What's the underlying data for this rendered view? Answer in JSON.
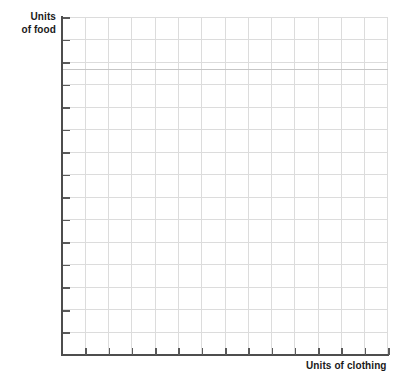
{
  "figure": {
    "type": "blank-grid-worksheet",
    "background_color": "#ffffff",
    "grid_color": "#dcdcdc",
    "axis_color": "#4d4d4d",
    "label_color": "#1a1a1a"
  },
  "y_axis": {
    "label_line1": "Units",
    "label_line2": "of food",
    "label_full": "Units of food",
    "tick_count": 15,
    "tick_labels": []
  },
  "x_axis": {
    "label": "Units of clothing",
    "tick_count": 14,
    "tick_labels": []
  },
  "chart_data": {
    "type": "line",
    "title": "",
    "subtitle": "",
    "xlabel": "Units of clothing",
    "ylabel": "Units of food",
    "series": [],
    "categories": [],
    "x": [],
    "values": [],
    "xlim": [
      0,
      14
    ],
    "ylim": [
      0,
      15
    ],
    "grid": true,
    "grid_columns": 14,
    "grid_rows": 15,
    "legend": false,
    "legend_position": "none",
    "annotations": [],
    "note": "Empty graph paper: axes and gridlines only, no plotted data, no numeric tick labels."
  }
}
